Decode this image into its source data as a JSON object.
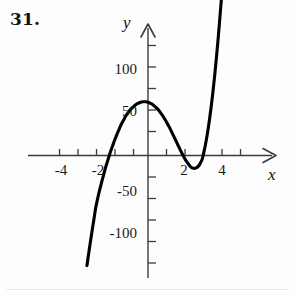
{
  "figure": {
    "problem_number": "31.",
    "axes": {
      "x_axis_label": "x",
      "y_axis_label": "y",
      "x_ticks_labeled": [
        "-4",
        "-2",
        "2",
        "4"
      ],
      "y_ticks_labeled": [
        "100",
        "50",
        "-50",
        "-100"
      ],
      "x_tick_values": [
        -4,
        -2,
        2,
        4
      ],
      "y_tick_values": [
        100,
        50,
        -50,
        -100
      ]
    }
  },
  "chart_data": {
    "type": "line",
    "title": "",
    "subtitle": "",
    "xlabel": "x",
    "ylabel": "y",
    "xlim": [
      -6.5,
      7.0
    ],
    "ylim": [
      -135,
      150
    ],
    "grid": false,
    "legend": null,
    "annotations": [],
    "x_tick_labels": [
      "-4",
      "-2",
      "2",
      "4"
    ],
    "x_tick_positions": [
      -4,
      -2,
      2,
      4
    ],
    "x_minor_tick_step": 1,
    "y_tick_labels": [
      "100",
      "50",
      "-50",
      "-100"
    ],
    "y_tick_positions": [
      100,
      50,
      -50,
      -100
    ],
    "y_minor_tick_step": 25,
    "series": [
      {
        "name": "f(x)",
        "approx_expression": "4.2*(x+2.82)*(x-2.92)^2",
        "roots": [
          -2.82,
          2.92
        ],
        "local_maximum": [
          -1.1,
          115
        ],
        "local_minimum": [
          2.35,
          -25
        ],
        "x": [
          -3.3,
          -3.2,
          -3.1,
          -3.0,
          -2.9,
          -2.82,
          -2.7,
          -2.6,
          -2.5,
          -2.4,
          -2.3,
          -2.2,
          -2.1,
          -2.0,
          -1.9,
          -1.8,
          -1.7,
          -1.6,
          -1.5,
          -1.4,
          -1.3,
          -1.2,
          -1.1,
          -1.0,
          -0.9,
          -0.8,
          -0.7,
          -0.6,
          -0.5,
          -0.4,
          -0.3,
          -0.2,
          -0.1,
          0.0,
          0.1,
          0.2,
          0.3,
          0.4,
          0.5,
          0.6,
          0.7,
          0.8,
          0.9,
          1.0,
          1.1,
          1.2,
          1.3,
          1.4,
          1.5,
          1.6,
          1.7,
          1.8,
          1.9,
          2.0,
          2.1,
          2.2,
          2.3,
          2.35,
          2.4,
          2.5,
          2.6,
          2.7,
          2.8,
          2.92,
          3.0,
          3.1,
          3.2,
          3.3,
          3.4,
          3.5,
          3.6,
          3.7,
          3.8,
          3.9,
          4.0,
          4.05
        ],
        "y": [
          -128.0,
          -113.0,
          -98.5,
          -84.5,
          -71.0,
          -60.0,
          -48.0,
          -39.0,
          -30.5,
          -22.5,
          -14.5,
          -7.5,
          -0.5,
          6.0,
          12.0,
          18.0,
          23.5,
          28.5,
          33.5,
          38.0,
          42.0,
          46.0,
          49.0,
          52.0,
          54.5,
          56.5,
          58.5,
          60.0,
          61.0,
          62.0,
          62.5,
          62.5,
          62.5,
          62.0,
          61.0,
          60.0,
          58.5,
          56.5,
          54.5,
          52.0,
          49.0,
          46.0,
          42.5,
          39.0,
          35.0,
          31.0,
          26.5,
          22.0,
          17.5,
          13.0,
          8.5,
          4.0,
          0.0,
          -4.0,
          -7.5,
          -10.5,
          -13.0,
          -14.0,
          -14.5,
          -15.0,
          -14.5,
          -13.0,
          -10.0,
          -5.0,
          2.0,
          12.0,
          24.0,
          38.0,
          54.0,
          72.0,
          92.0,
          114.0,
          138.0,
          164.0,
          191.0,
          205.0
        ]
      }
    ]
  }
}
